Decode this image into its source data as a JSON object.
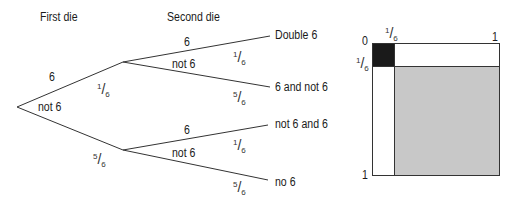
{
  "tree": {
    "headers": {
      "first": "First die",
      "second": "Second die"
    },
    "first_branches": {
      "upper": {
        "label": "6",
        "prob_num": "1",
        "prob_den": "6"
      },
      "lower": {
        "label": "not 6",
        "prob_num": "5",
        "prob_den": "6"
      }
    },
    "second_branches": [
      {
        "label": "6",
        "prob_num": "1",
        "prob_den": "6",
        "outcome": "Double 6"
      },
      {
        "label": "not 6",
        "prob_num": "5",
        "prob_den": "6",
        "outcome": "6 and not 6"
      },
      {
        "label": "6",
        "prob_num": "1",
        "prob_den": "6",
        "outcome": "not 6 and 6"
      },
      {
        "label": "not 6",
        "prob_num": "5",
        "prob_den": "6",
        "outcome": "no 6"
      }
    ]
  },
  "area_diagram": {
    "axis_labels": {
      "top_left": "0",
      "top_right": "1",
      "bottom_left": "1"
    },
    "divider_num": "1",
    "divider_den": "6",
    "colors": {
      "double_six": "#1a1a1a",
      "no_six": "#c8c8c8",
      "border": "#333333"
    }
  }
}
